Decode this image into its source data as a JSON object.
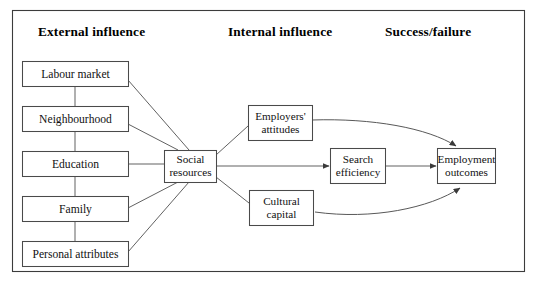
{
  "figure": {
    "kind": "conceptual-flow-diagram",
    "frame": {
      "stroke_color": "#3c3c3c",
      "fill_color": "#ffffff"
    },
    "line_color": "#585858",
    "text_color": "#000000"
  },
  "columns": [
    {
      "id": "external",
      "label": "External influence"
    },
    {
      "id": "internal",
      "label": "Internal influence"
    },
    {
      "id": "outcome",
      "label": "Success/failure"
    }
  ],
  "nodes": {
    "labour_market": {
      "label": "Labour market"
    },
    "neighbourhood": {
      "label": "Neighbourhood"
    },
    "education": {
      "label": "Education"
    },
    "family": {
      "label": "Family"
    },
    "personal_attributes": {
      "label": "Personal attributes"
    },
    "social_resources": {
      "line1": "Social",
      "line2": "resources"
    },
    "employers_attitudes": {
      "line1": "Employers'",
      "line2": "attitudes"
    },
    "cultural_capital": {
      "line1": "Cultural",
      "line2": "capital"
    },
    "search_efficiency": {
      "line1": "Search",
      "line2": "efficiency"
    },
    "employment_outcomes": {
      "line1": "Employment",
      "line2": "outcomes"
    }
  },
  "edges": [
    {
      "from": "labour_market",
      "to": "neighbourhood",
      "style": "plain"
    },
    {
      "from": "neighbourhood",
      "to": "education",
      "style": "plain"
    },
    {
      "from": "education",
      "to": "family",
      "style": "plain"
    },
    {
      "from": "family",
      "to": "personal_attributes",
      "style": "plain"
    },
    {
      "from": "labour_market",
      "to": "social_resources",
      "style": "plain"
    },
    {
      "from": "neighbourhood",
      "to": "social_resources",
      "style": "plain"
    },
    {
      "from": "education",
      "to": "social_resources",
      "style": "plain"
    },
    {
      "from": "family",
      "to": "social_resources",
      "style": "plain"
    },
    {
      "from": "personal_attributes",
      "to": "social_resources",
      "style": "plain"
    },
    {
      "from": "social_resources",
      "to": "employers_attitudes",
      "style": "plain"
    },
    {
      "from": "social_resources",
      "to": "cultural_capital",
      "style": "plain"
    },
    {
      "from": "social_resources",
      "to": "search_efficiency",
      "style": "arrow"
    },
    {
      "from": "search_efficiency",
      "to": "employment_outcomes",
      "style": "arrow"
    },
    {
      "from": "employers_attitudes",
      "to": "employment_outcomes",
      "style": "curved-arrow"
    },
    {
      "from": "cultural_capital",
      "to": "employment_outcomes",
      "style": "curved-arrow"
    }
  ]
}
